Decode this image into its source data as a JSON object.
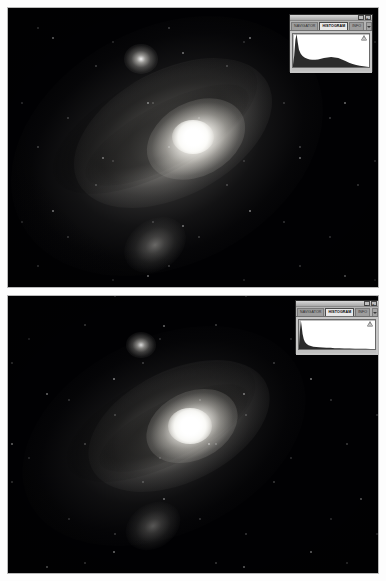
{
  "document": {
    "kind": "screenshot-pair",
    "figure_count": 2
  },
  "panels": [
    {
      "id": "panel-top",
      "label": "Top astrophotograph of the Andromeda Galaxy",
      "subject": "M31 Andromeda Galaxy",
      "appearance": "stretched / brighter rendering with visible outer halo and dust lanes",
      "objects": [
        {
          "name": "M31 core",
          "label": "Andromeda Galaxy nucleus"
        },
        {
          "name": "M32",
          "label": "Satellite galaxy M32"
        },
        {
          "name": "M110",
          "label": "Satellite galaxy M110"
        }
      ],
      "histogram": {
        "titlebar": {
          "minimize": "–",
          "close": "×"
        },
        "tabs": [
          {
            "label": "NAVIGATOR",
            "active": false
          },
          {
            "label": "HISTOGRAM",
            "active": true
          },
          {
            "label": "INFO",
            "active": false
          }
        ],
        "menu_icon": "chevron-down-icon",
        "warning_icon": "cached-data-warning-icon",
        "chart_data": {
          "type": "area",
          "title": "Histogram",
          "xlabel": "Level",
          "ylabel": "Pixel count",
          "xlim": [
            0,
            255
          ],
          "ylim": [
            0,
            100
          ],
          "grid": false,
          "x": [
            0,
            4,
            8,
            12,
            16,
            20,
            26,
            32,
            40,
            48,
            56,
            64,
            74,
            84,
            94,
            104,
            116,
            128,
            140,
            152,
            164,
            176,
            188,
            200,
            212,
            224,
            236,
            248,
            255
          ],
          "values": [
            6,
            34,
            82,
            100,
            74,
            52,
            40,
            33,
            28,
            25,
            23,
            22,
            22,
            23,
            25,
            27,
            29,
            30,
            29,
            27,
            23,
            18,
            13,
            9,
            6,
            4,
            2,
            1,
            0
          ]
        }
      }
    },
    {
      "id": "panel-bottom",
      "label": "Bottom astrophotograph of the Andromeda Galaxy",
      "subject": "M31 Andromeda Galaxy",
      "appearance": "darker / unstretched rendering with compact core and suppressed halo",
      "objects": [
        {
          "name": "M31 core",
          "label": "Andromeda Galaxy nucleus"
        },
        {
          "name": "M32",
          "label": "Satellite galaxy M32"
        },
        {
          "name": "M110",
          "label": "Satellite galaxy M110"
        }
      ],
      "histogram": {
        "titlebar": {
          "minimize": "–",
          "close": "×"
        },
        "tabs": [
          {
            "label": "NAVIGATOR",
            "active": false
          },
          {
            "label": "HISTOGRAM",
            "active": true
          },
          {
            "label": "INFO",
            "active": false
          }
        ],
        "menu_icon": "chevron-down-icon",
        "warning_icon": "cached-data-warning-icon",
        "chart_data": {
          "type": "area",
          "title": "Histogram",
          "xlabel": "Level",
          "ylabel": "Pixel count",
          "xlim": [
            0,
            255
          ],
          "ylim": [
            0,
            100
          ],
          "grid": false,
          "x": [
            0,
            3,
            6,
            9,
            12,
            16,
            20,
            26,
            32,
            40,
            48,
            58,
            68,
            80,
            92,
            106,
            120,
            136,
            152,
            170,
            188,
            206,
            224,
            240,
            255
          ],
          "values": [
            10,
            62,
            100,
            78,
            52,
            34,
            24,
            17,
            13,
            10,
            8,
            7,
            6,
            5,
            4,
            4,
            3,
            3,
            2,
            2,
            1,
            1,
            1,
            0,
            0
          ]
        }
      }
    }
  ],
  "colors": {
    "page_background": "#fdfdfd",
    "sky": "#010103",
    "star": "#ffffff",
    "palette_face": "#c6c6c6",
    "palette_active_tab": "#e8e8e8",
    "histogram_fill": "#2b2b2b",
    "histogram_background": "#ffffff"
  }
}
